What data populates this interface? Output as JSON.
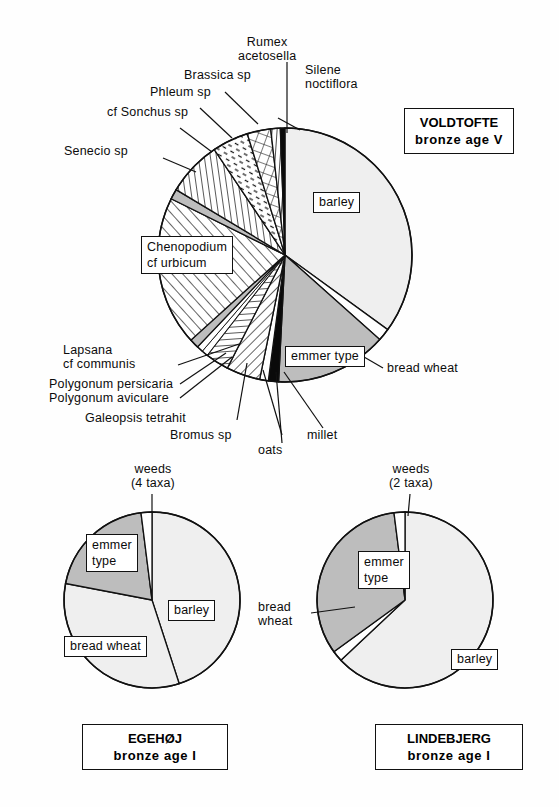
{
  "figure": {
    "kind": "three-pie-chart-figure",
    "background": "#fefefe",
    "stroke_color": "#111111"
  },
  "chart_data": [
    {
      "type": "pie",
      "id": "voldtofte",
      "title": "VOLDTOFTE",
      "subtitle": "bronze age V",
      "center": [
        285,
        255
      ],
      "radius": 127,
      "start_angle_deg": 0,
      "direction": "clockwise",
      "labels": [
        "barley",
        "bread wheat",
        "emmer type",
        "millet",
        "oats",
        "Bromus sp",
        "Galeopsis tetrahit",
        "Polygonum aviculare",
        "Polygonum persicaria",
        "Lapsana cf communis",
        "Chenopodium cf urbicum",
        "Senecio sp",
        "cf Sonchus sp",
        "Phleum sp",
        "Brassica sp",
        "Rumex acetosella",
        "Silene noctiflora"
      ],
      "values": [
        35.0,
        1.6,
        14.2,
        1.3,
        1.1,
        4.3,
        3.0,
        0.8,
        0.8,
        1.2,
        19.0,
        1.3,
        7.0,
        4.6,
        3.0,
        1.2,
        0.6
      ],
      "patterns": [
        "solid-light",
        "white",
        "solid-grey",
        "black",
        "white",
        "hatch-45",
        "hlines",
        "white",
        "white",
        "solid-grey",
        "hatch-135",
        "solid-grey",
        "vlines",
        "dashes",
        "crosshatch",
        "hlines",
        "black"
      ]
    },
    {
      "type": "pie",
      "id": "egehoj",
      "title": "EGEHØJ",
      "subtitle": "bronze age I",
      "center": [
        152,
        600
      ],
      "radius": 88,
      "start_angle_deg": 0,
      "direction": "clockwise",
      "labels": [
        "barley",
        "bread wheat",
        "emmer type",
        "weeds (4 taxa)"
      ],
      "values": [
        45.0,
        33.0,
        20.0,
        2.0
      ],
      "patterns": [
        "solid-light",
        "solid-light",
        "solid-grey",
        "white"
      ]
    },
    {
      "type": "pie",
      "id": "lindebjerg",
      "title": "LINDEBJERG",
      "subtitle": "bronze age I",
      "center": [
        405,
        600
      ],
      "radius": 88,
      "start_angle_deg": 0,
      "direction": "clockwise",
      "labels": [
        "barley",
        "bread wheat",
        "emmer type",
        "weeds (2 taxa)"
      ],
      "values": [
        63.0,
        2.0,
        33.0,
        2.0
      ],
      "patterns": [
        "solid-light",
        "white",
        "solid-grey",
        "white"
      ]
    }
  ],
  "voldtofte": {
    "site_title": "VOLDTOFTE",
    "site_subtitle": "bronze age V",
    "inner_labels": {
      "barley": "barley",
      "emmer": "emmer type",
      "chenopodium_l1": "Chenopodium",
      "chenopodium_l2": "cf  urbicum"
    },
    "outer_labels": {
      "rumex_l1": "Rumex",
      "rumex_l2": "acetosella",
      "silene_l1": "Silene",
      "silene_l2": "noctiflora",
      "brassica": "Brassica  sp",
      "phleum": "Phleum  sp",
      "sonchus": "cf Sonchus  sp",
      "senecio": "Senecio  sp",
      "lapsana_l1": "Lapsana",
      "lapsana_l2": "cf  communis",
      "polygonum_persicaria": "Polygonum  persicaria",
      "polygonum_aviculare": "Polygonum  aviculare",
      "galeopsis": "Galeopsis  tetrahit",
      "bromus": "Bromus sp",
      "oats": "oats",
      "millet": "millet",
      "bread_wheat": "bread  wheat"
    }
  },
  "egehoj": {
    "site_title": "EGEHØJ",
    "site_subtitle": "bronze  age  I",
    "weeds_l1": "weeds",
    "weeds_l2": "(4  taxa)",
    "emmer_l1": "emmer",
    "emmer_l2": "type",
    "barley": "barley",
    "bread_wheat": "bread  wheat"
  },
  "lindebjerg": {
    "site_title": "LINDEBJERG",
    "site_subtitle": "bronze  age  I",
    "weeds_l1": "weeds",
    "weeds_l2": "(2  taxa)",
    "emmer_l1": "emmer",
    "emmer_l2": "type",
    "barley": "barley",
    "bread_wheat_l1": "bread",
    "bread_wheat_l2": "wheat"
  }
}
